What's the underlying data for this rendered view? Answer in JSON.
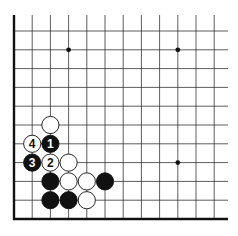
{
  "diagram": {
    "type": "go-board-corner",
    "corner": "bottom-left",
    "grid": {
      "columns": 12,
      "rows": 11,
      "origin_x": 14,
      "origin_y": 219,
      "spacing_x": 18.2,
      "spacing_y": 18.8,
      "right_end_x": 228,
      "top_end_y": 15
    },
    "star_points": [
      {
        "col": 3,
        "row": 9
      },
      {
        "col": 9,
        "row": 9
      },
      {
        "col": 9,
        "row": 3
      }
    ],
    "stones": [
      {
        "color": "white",
        "col": 2,
        "row": 5,
        "label": ""
      },
      {
        "color": "white",
        "col": 1,
        "row": 4,
        "label": "4"
      },
      {
        "color": "black",
        "col": 2,
        "row": 4,
        "label": "1"
      },
      {
        "color": "black",
        "col": 1,
        "row": 3,
        "label": "3"
      },
      {
        "color": "white",
        "col": 2,
        "row": 3,
        "label": "2"
      },
      {
        "color": "white",
        "col": 3,
        "row": 3,
        "label": ""
      },
      {
        "color": "black",
        "col": 2,
        "row": 2,
        "label": ""
      },
      {
        "color": "white",
        "col": 3,
        "row": 2,
        "label": ""
      },
      {
        "color": "white",
        "col": 4,
        "row": 2,
        "label": ""
      },
      {
        "color": "black",
        "col": 5,
        "row": 2,
        "label": ""
      },
      {
        "color": "black",
        "col": 2,
        "row": 1,
        "label": ""
      },
      {
        "color": "black",
        "col": 3,
        "row": 1,
        "label": ""
      },
      {
        "color": "white",
        "col": 4,
        "row": 1,
        "label": ""
      }
    ],
    "colors": {
      "line": "#333333",
      "edge": "#111111",
      "black_stone": "#111111",
      "white_stone": "#ffffff",
      "background": "#ffffff"
    }
  }
}
